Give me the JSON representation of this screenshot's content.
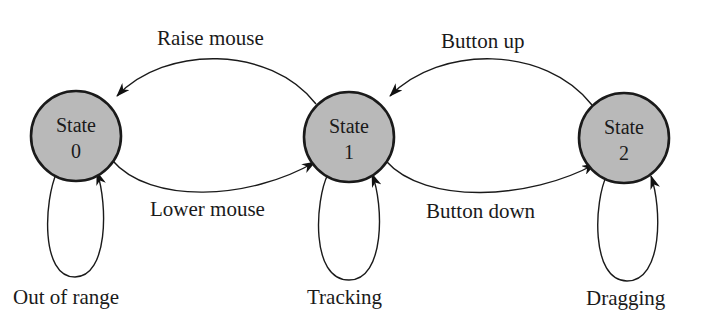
{
  "diagram": {
    "type": "state-transition",
    "colors": {
      "state_fill": "#b9b9b9",
      "stroke": "#1a1a1a",
      "background": "#ffffff"
    },
    "states": [
      {
        "id": "0",
        "line1": "State",
        "line2": "0"
      },
      {
        "id": "1",
        "line1": "State",
        "line2": "1"
      },
      {
        "id": "2",
        "line1": "State",
        "line2": "2"
      }
    ],
    "transitions": [
      {
        "from": "1",
        "to": "0",
        "label": "Raise mouse"
      },
      {
        "from": "0",
        "to": "1",
        "label": "Lower mouse"
      },
      {
        "from": "2",
        "to": "1",
        "label": "Button up"
      },
      {
        "from": "1",
        "to": "2",
        "label": "Button down"
      },
      {
        "from": "0",
        "to": "0",
        "label": "Out of range"
      },
      {
        "from": "1",
        "to": "1",
        "label": "Tracking"
      },
      {
        "from": "2",
        "to": "2",
        "label": "Dragging"
      }
    ]
  }
}
